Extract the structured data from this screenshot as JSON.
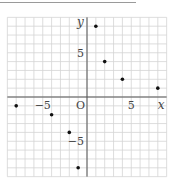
{
  "chart_data": {
    "type": "scatter",
    "title": "",
    "xlabel": "x",
    "ylabel": "y",
    "origin_label": "O",
    "xlim": [
      -9,
      9
    ],
    "ylim": [
      -9,
      9
    ],
    "grid": true,
    "grid_step": 1,
    "x_ticks": [
      {
        "value": -5,
        "label": "−5"
      },
      {
        "value": 5,
        "label": "5"
      }
    ],
    "y_ticks": [
      {
        "value": 5,
        "label": "5"
      },
      {
        "value": -5,
        "label": "−5"
      }
    ],
    "points": [
      {
        "x": 1,
        "y": 8
      },
      {
        "x": 2,
        "y": 4
      },
      {
        "x": 4,
        "y": 2
      },
      {
        "x": 8,
        "y": 1
      },
      {
        "x": -8,
        "y": -1
      },
      {
        "x": -4,
        "y": -2
      },
      {
        "x": -2,
        "y": -4
      },
      {
        "x": -1,
        "y": -8
      }
    ],
    "colors": {
      "grid": "#d4d4d4",
      "axis": "#555555",
      "point": "#111111",
      "text": "#444444"
    }
  }
}
